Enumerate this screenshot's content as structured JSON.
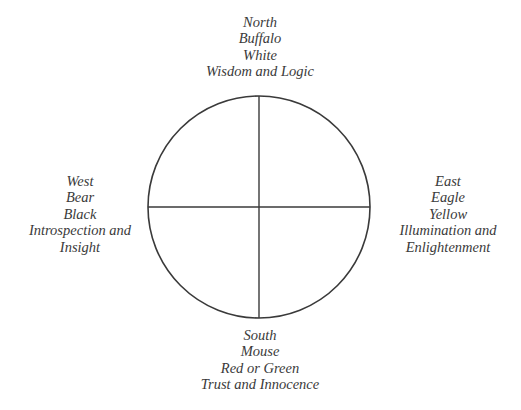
{
  "diagram": {
    "type": "four-direction-wheel",
    "line_color": "#3a3a3a",
    "text_color": "#3a3a3a",
    "background": "#ffffff",
    "circle": {
      "cx": 259,
      "cy": 207,
      "r": 111
    },
    "directions": {
      "north": {
        "direction": "North",
        "animal": "Buffalo",
        "color": "White",
        "qualities": "Wisdom and Logic"
      },
      "east": {
        "direction": "East",
        "animal": "Eagle",
        "color": "Yellow",
        "qualities_line1": "Illumination and",
        "qualities_line2": "Enlightenment"
      },
      "south": {
        "direction": "South",
        "animal": "Mouse",
        "color": "Red or Green",
        "qualities": "Trust and Innocence"
      },
      "west": {
        "direction": "West",
        "animal": "Bear",
        "color": "Black",
        "qualities_line1": "Introspection and",
        "qualities_line2": "Insight"
      }
    }
  }
}
